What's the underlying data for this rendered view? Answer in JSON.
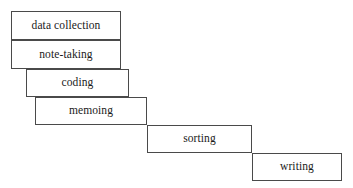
{
  "diagram": {
    "type": "stepped-cascade-flow",
    "title": "",
    "canvas": {
      "width": 353,
      "height": 188,
      "background": "#ffffff"
    },
    "style": {
      "border_color": "#4a4a4a",
      "box_fill": "#ffffff",
      "text_color": "#1a1a1a",
      "border_width_px": 1
    },
    "stages": [
      {
        "id": "data-collection",
        "label": "data collection",
        "order": 1,
        "x": 11,
        "y": 11,
        "width": 110,
        "height": 29
      },
      {
        "id": "note-taking",
        "label": "note-taking",
        "order": 2,
        "x": 11,
        "y": 40,
        "width": 110,
        "height": 29
      },
      {
        "id": "coding",
        "label": "coding",
        "order": 3,
        "x": 26,
        "y": 69,
        "width": 103,
        "height": 28
      },
      {
        "id": "memoing",
        "label": "memoing",
        "order": 4,
        "x": 35,
        "y": 97,
        "width": 112,
        "height": 28
      },
      {
        "id": "sorting",
        "label": "sorting",
        "order": 5,
        "x": 147,
        "y": 125,
        "width": 105,
        "height": 28
      },
      {
        "id": "writing",
        "label": "writing",
        "order": 6,
        "x": 252,
        "y": 153,
        "width": 90,
        "height": 28
      }
    ]
  }
}
